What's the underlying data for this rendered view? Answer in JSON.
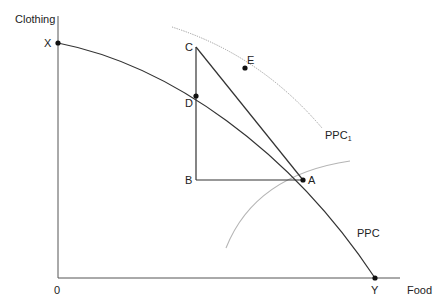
{
  "diagram": {
    "type": "production-possibility-curve",
    "axes": {
      "y_label": "Clothing",
      "x_label": "Food",
      "origin_label": "0"
    },
    "curves": [
      {
        "name": "PPC",
        "label": "PPC",
        "style": "solid",
        "color": "#333333"
      },
      {
        "name": "PPC1",
        "label": "PPC",
        "subscript": "1",
        "style": "dotted",
        "color": "#999999"
      },
      {
        "name": "indifference-arc",
        "label": "",
        "style": "solid",
        "color": "#aaaaaa"
      }
    ],
    "points": [
      {
        "id": "X",
        "label": "X",
        "x": 58,
        "y": 43,
        "dot": true
      },
      {
        "id": "Y",
        "label": "Y",
        "x": 375,
        "y": 278,
        "dot": true
      },
      {
        "id": "A",
        "label": "A",
        "x": 303,
        "y": 180,
        "dot": true
      },
      {
        "id": "B",
        "label": "B",
        "x": 196,
        "y": 180,
        "dot": false
      },
      {
        "id": "C",
        "label": "C",
        "x": 196,
        "y": 47,
        "dot": false
      },
      {
        "id": "D",
        "label": "D",
        "x": 196,
        "y": 96,
        "dot": true
      },
      {
        "id": "E",
        "label": "E",
        "x": 245,
        "y": 68,
        "dot": true
      }
    ],
    "colors": {
      "axis": "#555555",
      "line": "#333333",
      "dotted": "#999999",
      "arc": "#b0b0b0"
    }
  }
}
